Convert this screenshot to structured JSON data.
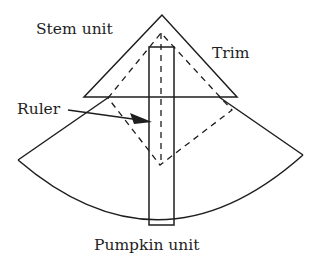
{
  "diagram": {
    "labels": {
      "stem_unit": "Stem unit",
      "trim": "Trim",
      "ruler": "Ruler",
      "pumpkin_unit": "Pumpkin unit"
    },
    "colors": {
      "stroke": "#1e1e1e",
      "background": "#ffffff"
    }
  }
}
